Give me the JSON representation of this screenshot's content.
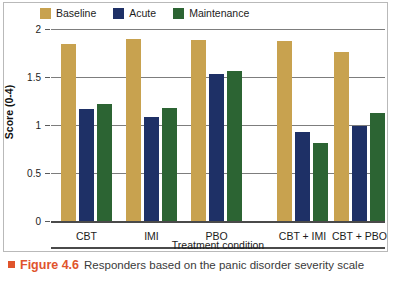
{
  "legend": {
    "items": [
      {
        "label": "Baseline",
        "color": "#c8a24f",
        "icon": "legend-swatch-icon"
      },
      {
        "label": "Acute",
        "color": "#1e3066",
        "icon": "legend-swatch-icon"
      },
      {
        "label": "Maintenance",
        "color": "#2c6433",
        "icon": "legend-swatch-icon"
      }
    ]
  },
  "axes": {
    "ylabel": "Score (0-4)",
    "xlabel": "Treatment condition",
    "yticks": [
      "0",
      "0.5",
      "1",
      "1.5",
      "2"
    ]
  },
  "caption": {
    "bullet": "caption-bullet-icon",
    "figure_number": "Figure 4.6",
    "text": "Responders based on the panic disorder severity scale",
    "accent_color": "#e0542c"
  },
  "chart_data": {
    "type": "bar",
    "title": "Responders based on the panic disorder severity scale",
    "xlabel": "Treatment condition",
    "ylabel": "Score (0-4)",
    "ylim": [
      0,
      2
    ],
    "ytick_values": [
      0,
      0.5,
      1,
      1.5,
      2
    ],
    "grid": true,
    "legend_position": "top-left",
    "categories": [
      "CBT",
      "IMI",
      "PBO",
      "CBT + IMI",
      "CBT + PBO"
    ],
    "series": [
      {
        "name": "Baseline",
        "color": "#c8a24f",
        "values": [
          1.84,
          1.9,
          1.89,
          1.87,
          1.76
        ]
      },
      {
        "name": "Acute",
        "color": "#1e3066",
        "values": [
          1.17,
          1.08,
          1.53,
          0.93,
          0.99
        ]
      },
      {
        "name": "Maintenance",
        "color": "#2c6433",
        "values": [
          1.22,
          1.18,
          1.56,
          0.81,
          1.12
        ]
      }
    ]
  }
}
